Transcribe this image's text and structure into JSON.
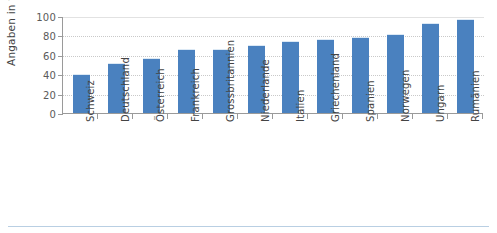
{
  "chart_data": {
    "type": "bar",
    "title": "",
    "xlabel": "",
    "ylabel": "Angaben in %",
    "ylim": [
      0,
      100
    ],
    "yticks": [
      0,
      20,
      40,
      60,
      80,
      100
    ],
    "ytick_labels": [
      "0",
      "20",
      "40",
      "60",
      "80",
      "100"
    ],
    "grid": true,
    "legend": "none",
    "bar_color": "#4a81bf",
    "categories": [
      "Schweiz",
      "Deutschland",
      "Österreich",
      "Frankreich",
      "Grossbritannien",
      "Niederlande",
      "Italien",
      "Griechenland",
      "Spanien",
      "Norwegen",
      "Ungarn",
      "Rumänien"
    ],
    "values": [
      39,
      51,
      56,
      65,
      65,
      69,
      73,
      75,
      77,
      80,
      92,
      96
    ]
  }
}
